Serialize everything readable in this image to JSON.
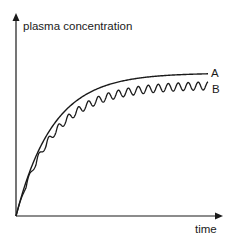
{
  "chart_data": {
    "type": "line",
    "title": "",
    "xlabel": "time",
    "ylabel": "plasma concentration",
    "grid": false,
    "legend_position": "inline-right",
    "x": [
      0,
      1,
      2,
      3,
      4,
      5,
      6,
      7,
      8,
      9,
      10
    ],
    "series": [
      {
        "name": "A",
        "description": "smooth exponential rise to plateau (continuous infusion)",
        "values": [
          0,
          0.63,
          0.86,
          0.95,
          0.98,
          0.99,
          1.0,
          1.0,
          1.0,
          1.0,
          1.0
        ]
      },
      {
        "name": "B",
        "description": "oscillating sawtooth rise to fluctuating plateau slightly below A (repeated doses)",
        "values": [
          0,
          0.55,
          0.76,
          0.85,
          0.89,
          0.91,
          0.92,
          0.92,
          0.92,
          0.92,
          0.92
        ]
      }
    ],
    "ylim": [
      0,
      1.2
    ],
    "xlim": [
      0,
      10
    ]
  },
  "labels": {
    "y_axis": "plasma concentration",
    "x_axis": "time",
    "series_a": "A",
    "series_b": "B"
  },
  "colors": {
    "line": "#1a1a1a",
    "background": "#ffffff"
  }
}
